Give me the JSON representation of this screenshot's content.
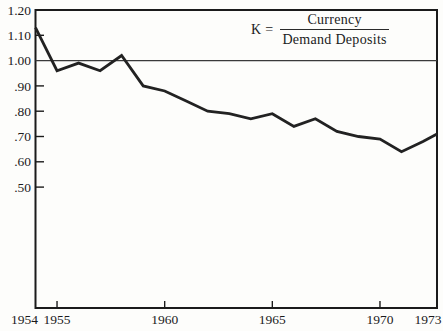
{
  "figure": {
    "background_color": "#fdfdfb",
    "ink_color": "#1b1b1b",
    "line_color": "#222222",
    "reference_line_color": "#3a3a3a"
  },
  "chart_data": {
    "type": "line",
    "legend": {
      "prefix": "K =",
      "numerator": "Currency",
      "denominator": "Demand Deposits"
    },
    "x": [
      1954,
      1955,
      1956,
      1957,
      1958,
      1959,
      1960,
      1961,
      1962,
      1963,
      1964,
      1965,
      1966,
      1967,
      1968,
      1969,
      1970,
      1971,
      1972,
      1973
    ],
    "series": [
      {
        "name": "K (currency to demand deposits ratio)",
        "values": [
          1.13,
          0.96,
          0.99,
          0.96,
          1.02,
          0.9,
          0.88,
          0.84,
          0.8,
          0.79,
          0.77,
          0.79,
          0.74,
          0.77,
          0.72,
          0.7,
          0.69,
          0.64,
          0.68,
          0.71
        ]
      }
    ],
    "reference_line": 1.0,
    "xlabel": "",
    "ylabel": "",
    "xlim": [
      1954,
      1973
    ],
    "ylim_labeled": [
      0.5,
      1.2
    ],
    "grid": false,
    "legend_position": "top-center",
    "y_axis": {
      "ticks": [
        {
          "label": "1.20",
          "value": 1.2,
          "tick": false
        },
        {
          "label": "1.10",
          "value": 1.1,
          "tick": true
        },
        {
          "label": "1.00",
          "value": 1.0,
          "tick": false
        },
        {
          "label": ".90",
          "value": 0.9,
          "tick": true
        },
        {
          "label": ".80",
          "value": 0.8,
          "tick": true
        },
        {
          "label": ".70",
          "value": 0.7,
          "tick": true
        },
        {
          "label": ".60",
          "value": 0.6,
          "tick": true
        },
        {
          "label": ".50",
          "value": 0.5,
          "tick": true
        }
      ]
    },
    "x_axis": {
      "ticks": [
        {
          "label": "1954",
          "year": 1954,
          "tick": false
        },
        {
          "label": "1955",
          "year": 1955,
          "tick": true
        },
        {
          "label": "1960",
          "year": 1960,
          "tick": true
        },
        {
          "label": "1965",
          "year": 1965,
          "tick": true
        },
        {
          "label": "1970",
          "year": 1970,
          "tick": true
        },
        {
          "label": "1973",
          "year": 1973,
          "tick": false
        }
      ]
    }
  }
}
